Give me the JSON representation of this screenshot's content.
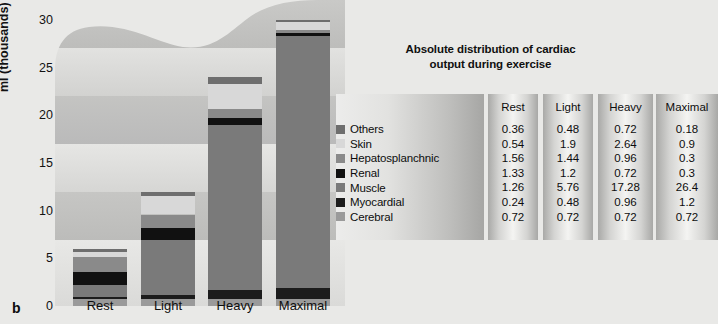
{
  "panel": {
    "letter": "b"
  },
  "chart_data": {
    "type": "bar",
    "stacked": true,
    "title": "Absolute distribution of cardiac output during exercise",
    "title_lines": [
      "Absolute distribution of cardiac",
      "output during exercise"
    ],
    "xlabel": "",
    "ylabel": "ml (thousands)",
    "categories": [
      "Rest",
      "Light",
      "Heavy",
      "Maximal"
    ],
    "ylim": [
      0,
      30
    ],
    "yticks": [
      30,
      25,
      20,
      15,
      10,
      5,
      0
    ],
    "grid": false,
    "legend_position": "right",
    "stack_order_bottom_to_top": [
      "Cerebral",
      "Myocardial",
      "Muscle",
      "Renal",
      "Hepatosplanchnic",
      "Skin",
      "Others"
    ],
    "series": [
      {
        "name": "Others",
        "color": "#6e6e6e",
        "values": [
          0.36,
          0.48,
          0.72,
          0.18
        ]
      },
      {
        "name": "Skin",
        "color": "#d8d8d8",
        "values": [
          0.54,
          1.9,
          2.64,
          0.9
        ]
      },
      {
        "name": "Hepatosplanchnic",
        "color": "#8a8a8a",
        "values": [
          1.56,
          1.44,
          0.96,
          0.3
        ]
      },
      {
        "name": "Renal",
        "color": "#111111",
        "values": [
          1.33,
          1.2,
          0.72,
          0.3
        ]
      },
      {
        "name": "Muscle",
        "color": "#7a7a7a",
        "values": [
          1.26,
          5.76,
          17.28,
          26.4
        ]
      },
      {
        "name": "Myocardial",
        "color": "#1c1c1c",
        "values": [
          0.24,
          0.48,
          0.96,
          1.2
        ]
      },
      {
        "name": "Cerebral",
        "color": "#9a9a9a",
        "values": [
          0.72,
          0.72,
          0.72,
          0.72
        ]
      }
    ],
    "totals": [
      6.01,
      11.98,
      24.0,
      30.0
    ]
  },
  "table": {
    "columns": [
      "Rest",
      "Light",
      "Heavy",
      "Maximal"
    ],
    "rows": [
      {
        "label": "Others",
        "swatch": "#6e6e6e",
        "values": [
          "0.36",
          "0.48",
          "0.72",
          "0.18"
        ]
      },
      {
        "label": "Skin",
        "swatch": "#d8d8d8",
        "values": [
          "0.54",
          "1.9",
          "2.64",
          "0.9"
        ]
      },
      {
        "label": "Hepatosplanchnic",
        "swatch": "#8a8a8a",
        "values": [
          "1.56",
          "1.44",
          "0.96",
          "0.3"
        ]
      },
      {
        "label": "Renal",
        "swatch": "#111111",
        "values": [
          "1.33",
          "1.2",
          "0.72",
          "0.3"
        ]
      },
      {
        "label": "Muscle",
        "swatch": "#7a7a7a",
        "values": [
          "1.26",
          "5.76",
          "17.28",
          "26.4"
        ]
      },
      {
        "label": "Myocardial",
        "swatch": "#1c1c1c",
        "values": [
          "0.24",
          "0.48",
          "0.96",
          "1.2"
        ]
      },
      {
        "label": "Cerebral",
        "swatch": "#9a9a9a",
        "values": [
          "0.72",
          "0.72",
          "0.72",
          "0.72"
        ]
      }
    ]
  }
}
